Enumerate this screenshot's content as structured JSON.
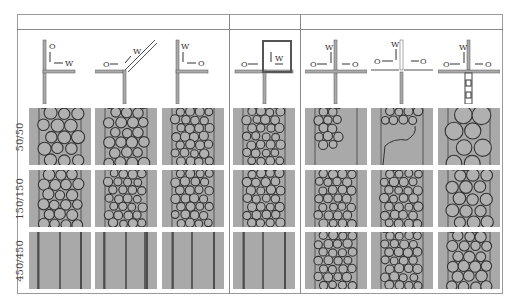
{
  "figure": {
    "row_labels": [
      "50/50",
      "150/150",
      "450/450"
    ],
    "groups": [
      {
        "name": "group-1",
        "columns": 3
      },
      {
        "name": "group-2",
        "columns": 1
      },
      {
        "name": "group-3",
        "columns": 3
      }
    ],
    "schematics": [
      {
        "id": "col1",
        "labels": [
          "O",
          "W"
        ],
        "type": "T-junction, O from top, W from right"
      },
      {
        "id": "col2",
        "labels": [
          "O",
          "W"
        ],
        "type": "Y-junction, O from left, W diagonal"
      },
      {
        "id": "col3",
        "labels": [
          "W",
          "O"
        ],
        "type": "T-junction, W from top, O from right"
      },
      {
        "id": "col4",
        "labels": [
          "O",
          "W"
        ],
        "type": "loop junction, O from left, W inside loop"
      },
      {
        "id": "col5",
        "labels": [
          "W",
          "O",
          "O"
        ],
        "type": "cross-junction, W from top, O both sides"
      },
      {
        "id": "col6",
        "labels": [
          "W",
          "O",
          "O"
        ],
        "type": "cross-junction offset"
      },
      {
        "id": "col7",
        "labels": [
          "W",
          "O",
          "O"
        ],
        "type": "cross-junction with constriction"
      }
    ],
    "cells": [
      [
        "foam-large",
        "foam-medium",
        "foam-small",
        "foam-small",
        "partial-foam",
        "broken-film",
        "large-bubbles"
      ],
      [
        "foam-medium",
        "foam-small",
        "foam-small",
        "foam-small",
        "foam-small",
        "foam-small",
        "foam-large"
      ],
      [
        "stratified",
        "stratified",
        "stratified",
        "stratified",
        "foam-small",
        "foam-small",
        "foam-medium"
      ]
    ],
    "colors": {
      "cell_bg": "#a9a9a9",
      "line": "#333333",
      "frame": "#9a9a9a"
    }
  }
}
